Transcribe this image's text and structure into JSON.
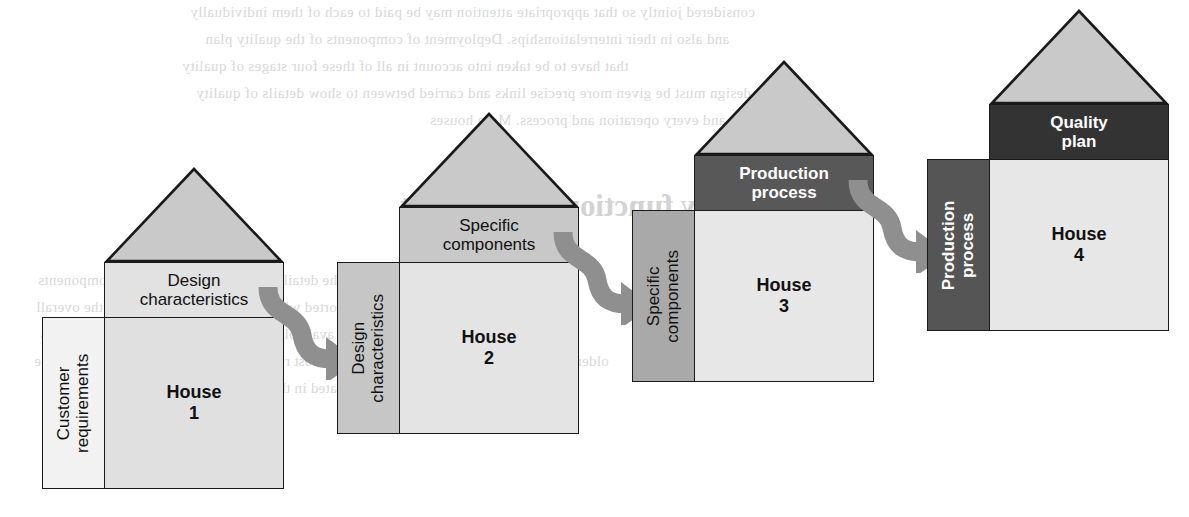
{
  "diagram": {
    "type": "process-flow",
    "house_count": 4,
    "arrow_count": 3,
    "arrow_color": "#8f8f8f",
    "outline_color": "#1a1a1a"
  },
  "houses": [
    {
      "id": "house-1",
      "body_label_line1": "House",
      "body_label_line2": "1",
      "roof_label_line1": "Design",
      "roof_label_line2": "characteristics",
      "side_label_line1": "Customer",
      "side_label_line2": "requirements",
      "roof_band_color": "#e2e2e2",
      "roof_tri_color": "#c9c9c9",
      "body_color": "#e0e0e0",
      "side_panel_color": "#f2f2f2",
      "roof_text_color": "#111111",
      "side_text_color": "#111111",
      "body_text_color": "#111111",
      "side_text_weight": "normal"
    },
    {
      "id": "house-2",
      "body_label_line1": "House",
      "body_label_line2": "2",
      "roof_label_line1": "Specific",
      "roof_label_line2": "components",
      "side_label_line1": "Design",
      "side_label_line2": "characteristics",
      "roof_band_color": "#c8c8c8",
      "roof_tri_color": "#c9c9c9",
      "body_color": "#e4e4e4",
      "side_panel_color": "#c6c6c6",
      "roof_text_color": "#111111",
      "side_text_color": "#111111",
      "body_text_color": "#111111",
      "side_text_weight": "normal"
    },
    {
      "id": "house-3",
      "body_label_line1": "House",
      "body_label_line2": "3",
      "roof_label_line1": "Production",
      "roof_label_line2": "process",
      "side_label_line1": "Specific",
      "side_label_line2": "components",
      "roof_band_color": "#585858",
      "roof_tri_color": "#c9c9c9",
      "body_color": "#e7e7e7",
      "side_panel_color": "#a9a9a9",
      "roof_text_color": "#ffffff",
      "side_text_color": "#111111",
      "body_text_color": "#111111",
      "side_text_weight": "normal"
    },
    {
      "id": "house-4",
      "body_label_line1": "House",
      "body_label_line2": "4",
      "roof_label_line1": "Quality",
      "roof_label_line2": "plan",
      "side_label_line1": "Production",
      "side_label_line2": "process",
      "roof_band_color": "#333333",
      "roof_tri_color": "#c9c9c9",
      "body_color": "#e7e7e7",
      "side_panel_color": "#555555",
      "roof_text_color": "#ffffff",
      "side_text_color": "#ffffff",
      "body_text_color": "#111111",
      "side_text_weight": "bold"
    }
  ],
  "arrows": [
    {
      "id": "arrow-1-to-2",
      "from": "house-1",
      "to": "house-2"
    },
    {
      "id": "arrow-2-to-3",
      "from": "house-2",
      "to": "house-3"
    },
    {
      "id": "arrow-3-to-4",
      "from": "house-3",
      "to": "house-4"
    }
  ],
  "ghost_text": {
    "line1": "considered jointly so that appropriate attention may be paid to each of them individually",
    "line2": "and also in their interrelationships. Deployment of components of the quality plan",
    "line3": "that have to be taken into account in all of these four stages of quality",
    "line4": "design must be given more precise links and carried between to show details of quality",
    "line5": "and every operation and process. More houses",
    "line6": "Quality function deployment",
    "line7": "based on these components of the detail requirements and specific components",
    "line8": "shown in the deployment are sorted with the relative importance to the overall",
    "line9": "age of these that must designed and available designs to satisfy the customer needs",
    "line10": "older components to produce which can be a most readily reachable for the customers table",
    "line11": "characteristics that are then translated in the production of the Wisconsin results"
  }
}
